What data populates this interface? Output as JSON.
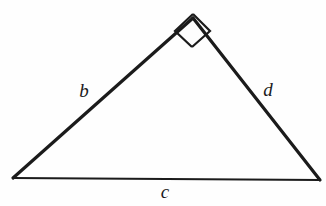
{
  "figure": {
    "kind": "right-triangle-diagram",
    "background_color": "#fefefe",
    "stroke_color": "#1b1b1b",
    "canvas": {
      "width": 326,
      "height": 206
    },
    "vertices": {
      "apex": {
        "x": 193,
        "y": 18
      },
      "bottom_left": {
        "x": 13,
        "y": 178
      },
      "bottom_right": {
        "x": 320,
        "y": 180
      }
    },
    "sides": [
      {
        "name": "left-side",
        "label": "b",
        "from": "bottom_left",
        "to": "apex",
        "stroke_width": 3.2,
        "label_position": {
          "x": 84,
          "y": 90
        }
      },
      {
        "name": "right-side",
        "label": "d",
        "from": "apex",
        "to": "bottom_right",
        "stroke_width": 3.2,
        "label_position": {
          "x": 268,
          "y": 89
        }
      },
      {
        "name": "base-side",
        "label": "c",
        "from": "bottom_left",
        "to": "bottom_right",
        "stroke_width": 2.0,
        "label_position": {
          "x": 165,
          "y": 191
        }
      }
    ],
    "right_angle_marker": {
      "name": "right-angle-square",
      "at_vertex": "apex",
      "points": "193,46 176,30 193,15 209,31",
      "stroke_width": 2.2,
      "description": "square marker indicating 90 degree angle at apex"
    }
  }
}
